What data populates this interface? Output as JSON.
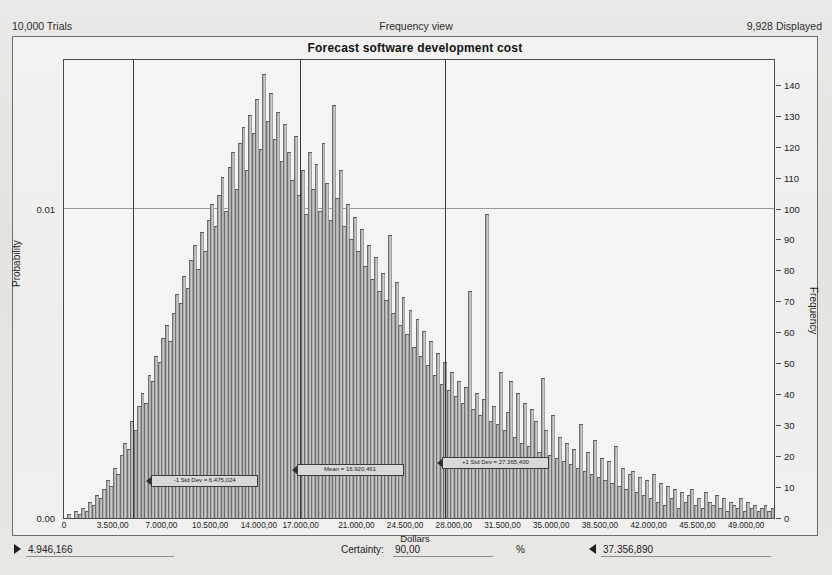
{
  "header": {
    "trials": "10,000 Trials",
    "view_mode": "Frequency view",
    "displayed": "9,928 Displayed"
  },
  "chart_title": "Forecast software development cost",
  "footer": {
    "min_value": "4.946,166",
    "certainty_label": "Certainty:",
    "certainty_value": "90,00",
    "percent_symbol": "%",
    "max_value": "37.356,890"
  },
  "chart_data": {
    "type": "bar",
    "title": "Forecast software development cost",
    "xlabel": "Dollars",
    "ylabel": "Probability",
    "y2label": "Frequency",
    "grid": true,
    "legend": "none",
    "xlim": [
      0,
      51000
    ],
    "ylim": [
      0,
      148
    ],
    "y2lim": [
      0,
      148
    ],
    "yleft_ticks": [
      "0.00",
      "0.01"
    ],
    "yleft_tick_values": [
      0,
      100
    ],
    "yright_ticks": [
      "0",
      "10",
      "20",
      "30",
      "40",
      "50",
      "60",
      "70",
      "80",
      "90",
      "100",
      "110",
      "120",
      "130",
      "140"
    ],
    "yright_tick_values": [
      0,
      10,
      20,
      30,
      40,
      50,
      60,
      70,
      80,
      90,
      100,
      110,
      120,
      130,
      140
    ],
    "xticks": [
      "0",
      "3.500,00",
      "7.000,00",
      "10.500,00",
      "14.000,00",
      "17.000,00",
      "21.000,00",
      "24.500,00",
      "28.000,00",
      "31.500,00",
      "35.000,00",
      "38.500,00",
      "42.000,00",
      "45.500,00",
      "49.000,00"
    ],
    "xtick_values": [
      0,
      3500,
      7000,
      10500,
      14000,
      17000,
      21000,
      24500,
      28000,
      31500,
      35000,
      38500,
      42000,
      45500,
      49000
    ],
    "bin_width": 250,
    "x_start": 250,
    "values": [
      1,
      0,
      2,
      1,
      3,
      2,
      5,
      4,
      7,
      6,
      9,
      12,
      10,
      16,
      14,
      20,
      24,
      22,
      31,
      28,
      36,
      40,
      37,
      46,
      44,
      52,
      50,
      58,
      62,
      57,
      66,
      72,
      69,
      78,
      74,
      83,
      88,
      80,
      92,
      86,
      96,
      101,
      94,
      104,
      110,
      99,
      113,
      118,
      106,
      121,
      126,
      112,
      130,
      124,
      135,
      119,
      143,
      128,
      137,
      122,
      131,
      115,
      127,
      118,
      109,
      123,
      104,
      112,
      98,
      118,
      106,
      114,
      99,
      121,
      108,
      96,
      133,
      103,
      112,
      94,
      101,
      90,
      97,
      86,
      93,
      81,
      88,
      77,
      84,
      73,
      79,
      70,
      91,
      66,
      76,
      62,
      71,
      59,
      67,
      55,
      64,
      52,
      60,
      49,
      57,
      46,
      53,
      43,
      50,
      41,
      47,
      39,
      44,
      37,
      42,
      73,
      35,
      40,
      33,
      38,
      98,
      31,
      36,
      30,
      47,
      28,
      34,
      44,
      26,
      40,
      24,
      37,
      23,
      35,
      31,
      21,
      45,
      28,
      20,
      33,
      19,
      26,
      18,
      24,
      17,
      22,
      16,
      30,
      15,
      21,
      14,
      25,
      13,
      19,
      12,
      18,
      11,
      23,
      10,
      16,
      9,
      14,
      15,
      8,
      13,
      7,
      12,
      6,
      14,
      5,
      11,
      4,
      10,
      6,
      9,
      3,
      8,
      5,
      7,
      9,
      4,
      6,
      3,
      8,
      5,
      4,
      7,
      3,
      6,
      2,
      5,
      4,
      3,
      6,
      2,
      5,
      3,
      4,
      2,
      3,
      4,
      2,
      3,
      5,
      2
    ],
    "markers": [
      {
        "id": "minus-one-std-dev",
        "label": "-1 Std Dev = 6.475,024",
        "x": 6475
      },
      {
        "id": "mean",
        "label": "Mean = 16.920,461",
        "x": 16920
      },
      {
        "id": "plus-one-std-dev",
        "label": "+1 Std Dev = 27.365,400",
        "x": 27365
      }
    ],
    "certainty_lines": [
      {
        "id": "certainty-lower-line",
        "x": 4946
      },
      {
        "id": "certainty-mean-line",
        "x": 16920
      },
      {
        "id": "certainty-upper-line",
        "x": 27365
      }
    ],
    "gridline_y": 100
  }
}
